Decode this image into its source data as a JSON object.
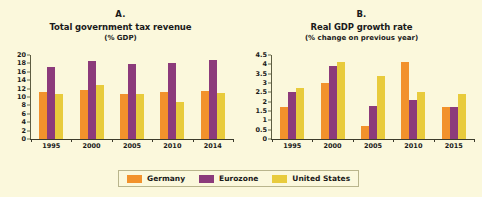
{
  "figure": {
    "background_color": "#fbf8dc"
  },
  "legend": {
    "position": "bottom-center",
    "entries": [
      {
        "label": "Germany",
        "color": "#f2922c",
        "key": "de"
      },
      {
        "label": "Eurozone",
        "color": "#8c3b7b",
        "key": "ez"
      },
      {
        "label": "United States",
        "color": "#e8cb3c",
        "key": "us"
      }
    ]
  },
  "chart_data": [
    {
      "type": "bar",
      "panel": "A.",
      "title": "Total government tax revenue",
      "subtitle": "(% GDP)",
      "xlabel": "",
      "ylabel": "",
      "ylim": [
        0,
        20
      ],
      "ytick_step": 2,
      "yticks": [
        "20",
        "18",
        "16",
        "14",
        "12",
        "10",
        "8",
        "6",
        "4",
        "2",
        "0"
      ],
      "ytick_values": [
        20,
        18,
        16,
        14,
        12,
        10,
        8,
        6,
        4,
        2,
        0
      ],
      "grid": false,
      "categories": [
        "1995",
        "2000",
        "2005",
        "2010",
        "2014"
      ],
      "series": [
        {
          "name": "Germany",
          "color": "#f2922c",
          "values": [
            11.3,
            11.7,
            10.7,
            11.1,
            11.5
          ]
        },
        {
          "name": "Eurozone",
          "color": "#8c3b7b",
          "values": [
            17.2,
            18.6,
            17.8,
            18.0,
            18.8
          ]
        },
        {
          "name": "United States",
          "color": "#e8cb3c",
          "values": [
            10.8,
            12.9,
            10.8,
            8.7,
            10.9
          ]
        }
      ]
    },
    {
      "type": "bar",
      "panel": "B.",
      "title": "Real GDP growth rate",
      "subtitle": "(% change on previous year)",
      "xlabel": "",
      "ylabel": "",
      "ylim": [
        0,
        4.5
      ],
      "ytick_step": 0.5,
      "yticks": [
        "4.5",
        "4",
        "3.5",
        "3",
        "2.5",
        "2",
        "1.5",
        "1",
        "0.5",
        "0"
      ],
      "ytick_values": [
        4.5,
        4,
        3.5,
        3,
        2.5,
        2,
        1.5,
        1,
        0.5,
        0
      ],
      "grid": false,
      "categories": [
        "1995",
        "2000",
        "2005",
        "2010",
        "2015"
      ],
      "series": [
        {
          "name": "Germany",
          "color": "#f2922c",
          "values": [
            1.7,
            3.0,
            0.7,
            4.1,
            1.7
          ]
        },
        {
          "name": "Eurozone",
          "color": "#8c3b7b",
          "values": [
            2.5,
            3.9,
            1.75,
            2.1,
            1.7
          ]
        },
        {
          "name": "United States",
          "color": "#e8cb3c",
          "values": [
            2.75,
            4.1,
            3.35,
            2.5,
            2.4
          ]
        }
      ]
    }
  ]
}
